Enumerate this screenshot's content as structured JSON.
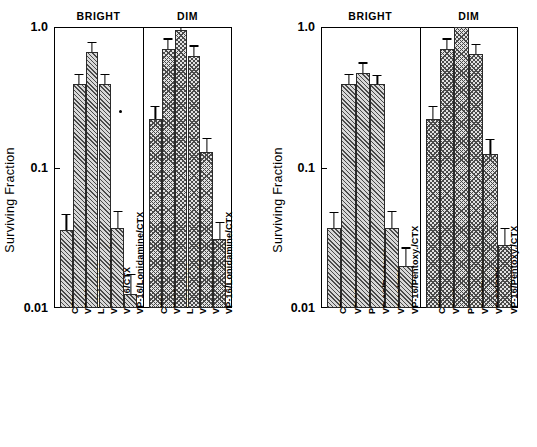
{
  "figure": {
    "ylabel": "Surviving Fraction",
    "ytick_labels": [
      "1.0",
      "0.1",
      "0.01"
    ],
    "group_labels": [
      "BRIGHT",
      "DIM"
    ]
  },
  "chart_data": [
    {
      "id": "left",
      "type": "bar",
      "title": "",
      "xlabel": "",
      "ylabel": "Surviving Fraction",
      "yscale": "log",
      "ylim": [
        0.01,
        1.0
      ],
      "yticks": [
        1.0,
        0.1,
        0.01
      ],
      "ytick_labels": [
        "1.0",
        "0.1",
        "0.01"
      ],
      "grid": false,
      "legend": "none",
      "groups": [
        "BRIGHT",
        "DIM"
      ],
      "categories": [
        "CTX",
        "VP-16",
        "Lonidamine",
        "VP-16/Lonidamine",
        "VP-16/CTX",
        "VP-16/Lonidamine/CTX"
      ],
      "series": [
        {
          "name": "BRIGHT",
          "hatch": "diagonal",
          "values": [
            0.036,
            0.39,
            0.66,
            0.39,
            0.037,
            0.0125
          ],
          "errors_up": [
            0.011,
            0.075,
            0.12,
            0.075,
            0.012,
            0.005
          ]
        },
        {
          "name": "DIM",
          "hatch": "crosshatch",
          "values": [
            0.22,
            0.7,
            0.95,
            0.62,
            0.128,
            0.031
          ],
          "errors_up": [
            0.055,
            0.13,
            0.05,
            0.12,
            0.035,
            0.01
          ]
        }
      ]
    },
    {
      "id": "right",
      "type": "bar",
      "title": "",
      "xlabel": "",
      "ylabel": "Surviving Fraction",
      "yscale": "log",
      "ylim": [
        0.01,
        1.0
      ],
      "yticks": [
        1.0,
        0.1,
        0.01
      ],
      "ytick_labels": [
        "1.0",
        "0.1",
        "0.01"
      ],
      "grid": false,
      "legend": "none",
      "groups": [
        "BRIGHT",
        "DIM"
      ],
      "categories": [
        "CTX",
        "VP-16",
        "Pentoxy.",
        "VP-16/Pentoxy.",
        "VP-16/CTX",
        "VP-16/Pentoxy./CTX"
      ],
      "series": [
        {
          "name": "BRIGHT",
          "hatch": "diagonal",
          "values": [
            0.037,
            0.39,
            0.47,
            0.39,
            0.037,
            0.02
          ],
          "errors_up": [
            0.011,
            0.075,
            0.09,
            0.065,
            0.012,
            0.007
          ]
        },
        {
          "name": "DIM",
          "hatch": "crosshatch",
          "values": [
            0.22,
            0.7,
            1.0,
            0.64,
            0.125,
            0.028
          ],
          "errors_up": [
            0.055,
            0.13,
            0.0,
            0.12,
            0.035,
            0.009
          ]
        }
      ]
    }
  ]
}
